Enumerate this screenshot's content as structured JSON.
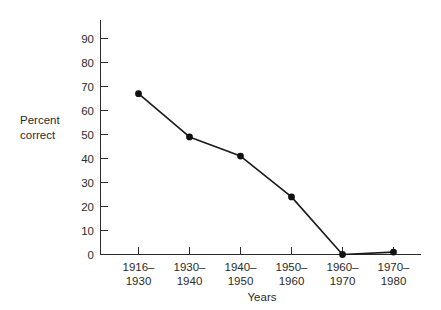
{
  "chart_data": {
    "type": "line",
    "title": "",
    "subtitle": "",
    "xlabel": "Years",
    "ylabel": "Percent correct",
    "ylabel_lines": [
      "Percent",
      "correct"
    ],
    "categories": [
      "1916–1930",
      "1930–1940",
      "1940–1950",
      "1950–1960",
      "1960–1970",
      "1970–1980"
    ],
    "category_lines": [
      [
        "1916–",
        "1930"
      ],
      [
        "1930–",
        "1940"
      ],
      [
        "1940–",
        "1950"
      ],
      [
        "1950–",
        "1960"
      ],
      [
        "1960–",
        "1970"
      ],
      [
        "1970–",
        "1980"
      ]
    ],
    "values": [
      67,
      49,
      41,
      24,
      0,
      1
    ],
    "ylim": [
      0,
      95
    ],
    "yticks": [
      0,
      10,
      20,
      30,
      40,
      50,
      60,
      70,
      80,
      90
    ],
    "ytick_labels": [
      "0",
      "10",
      "20",
      "30",
      "40",
      "50",
      "60",
      "70",
      "80",
      "90"
    ],
    "grid": false,
    "legend": false,
    "legend_position": "none",
    "marker": "filled-circle",
    "line_color": "#1a1a1a",
    "marker_color": "#111111",
    "axis_color": "#2b2b2b",
    "background_color": "#ffffff"
  },
  "axis": {
    "y_title_line1": "Percent",
    "y_title_line2": "correct",
    "x_title": "Years"
  },
  "ytick_labels": {
    "t0": "0",
    "t1": "10",
    "t2": "20",
    "t3": "30",
    "t4": "40",
    "t5": "50",
    "t6": "60",
    "t7": "70",
    "t8": "80",
    "t9": "90"
  },
  "xtick_labels": {
    "c0a": "1916–",
    "c0b": "1930",
    "c1a": "1930–",
    "c1b": "1940",
    "c2a": "1940–",
    "c2b": "1950",
    "c3a": "1950–",
    "c3b": "1960",
    "c4a": "1960–",
    "c4b": "1970",
    "c5a": "1970–",
    "c5b": "1980"
  }
}
